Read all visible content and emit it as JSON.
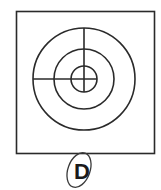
{
  "figure": {
    "option_label": "D",
    "colors": {
      "stroke": "#2a2a2a",
      "background": "#ffffff"
    }
  }
}
